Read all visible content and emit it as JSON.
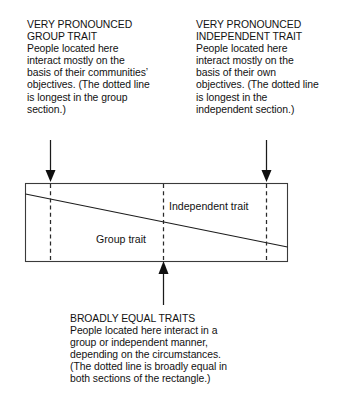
{
  "figure": {
    "annotations": {
      "left": {
        "heading": "VERY PRONOUNCED\nGROUP TRAIT",
        "body": "People located here\ninteract mostly on the\nbasis of their communities’\nobjectives. (The dotted line\nis longest in the group\nsection.)",
        "full": "VERY PRONOUNCED\nGROUP TRAIT\nPeople located here\ninteract mostly on the\nbasis of their communities’\nobjectives. (The dotted line\nis longest in the group\nsection.)"
      },
      "right": {
        "heading": "VERY PRONOUNCED\nINDEPENDENT TRAIT",
        "body": "People located here\ninteract mostly on the\nbasis of their own\nobjectives. (The dotted line\nis longest in the\nindependent section.)",
        "full": "VERY PRONOUNCED\nINDEPENDENT TRAIT\nPeople located here\ninteract mostly on the\nbasis of their own\nobjectives. (The dotted line\nis longest in the\nindependent section.)"
      },
      "bottom": {
        "heading": "BROADLY EQUAL TRAITS",
        "body": "People located here interact in a\ngroup or independent manner,\ndepending on the circumstances.\n(The dotted line is broadly equal in\nboth sections of the rectangle.)",
        "full": "BROADLY EQUAL TRAITS\nPeople located here interact in a\ngroup or independent manner,\ndepending on the circumstances.\n(The dotted line is broadly equal in\nboth sections of the rectangle.)"
      }
    },
    "inner_labels": {
      "independent": "Independent trait",
      "group": "Group trait"
    },
    "icons": {
      "left_arrow": "arrow-down-icon",
      "right_arrow": "arrow-down-icon",
      "bottom_arrow": "arrow-up-icon"
    },
    "colors": {
      "background": "#ffffff",
      "text": "#121212",
      "rectangle_stroke": "#3a3a3a",
      "diagonal_stroke": "#1d1d1d",
      "dashed_stroke": "#2a2a2a",
      "arrow": "#0f0f0f"
    }
  }
}
